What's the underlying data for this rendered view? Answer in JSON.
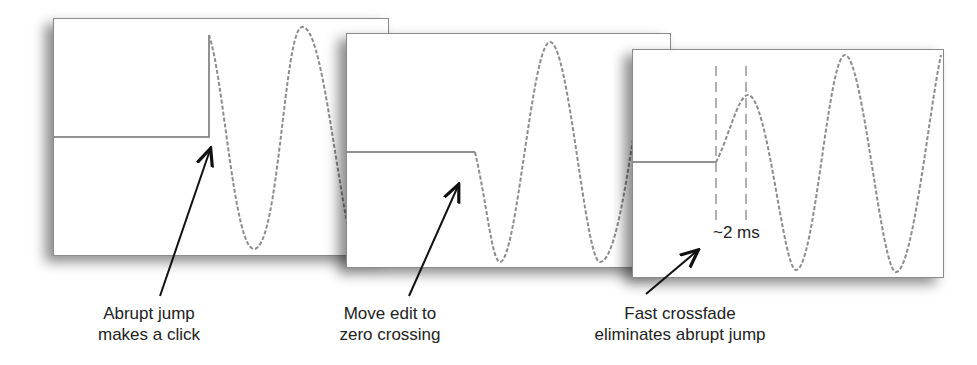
{
  "figure": {
    "panels": [
      {
        "id": "abrupt",
        "caption_line1": "Abrupt jump",
        "caption_line2": "makes a click"
      },
      {
        "id": "zero-crossing",
        "caption_line1": "Move edit to",
        "caption_line2": "zero crossing"
      },
      {
        "id": "crossfade",
        "caption_line1": "Fast crossfade",
        "caption_line2": "eliminates abrupt jump",
        "annotation": "~2 ms"
      }
    ],
    "colors": {
      "waveform": "#8c8c8c",
      "flat_line": "#6e6e6e",
      "arrow": "#111111",
      "frame": "#8a8a8a"
    }
  }
}
